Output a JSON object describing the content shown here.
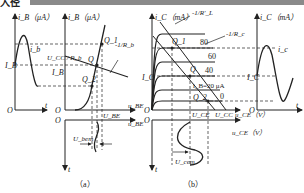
{
  "header": {
    "tag": "入径"
  },
  "panel_a": {
    "caption": "（a）",
    "left_axis": {
      "y_label": "i_B（μA）",
      "x_label": "t",
      "origin": "O",
      "level_label": "I_B",
      "curve_label": "i_b"
    },
    "input_char": {
      "y_label": "i_B（μA）",
      "x_label": "u_BE",
      "origin": "O",
      "load_line_label": "U_CC / R_b",
      "slope_label": "-1/R_b",
      "points": [
        "Q_1",
        "Q",
        "Q_2"
      ],
      "ib_level": "I_B",
      "ube_label": "U_BE"
    },
    "lower_axis": {
      "origin": "O",
      "x_label": "u_BE",
      "y_label": "t",
      "amp_label": "U_bem"
    }
  },
  "panel_b": {
    "caption": "（b）",
    "output_char": {
      "y_label": "i_C（mA）",
      "x_label": "u_CE（V）",
      "origin": "O",
      "ac_load_slope": "-1/R'_L",
      "dc_load_slope": "-1/R_c",
      "ib_curves": [
        "80",
        "60",
        "40",
        "i_B=20 μA",
        "0"
      ],
      "points": [
        "Q_1",
        "Q",
        "Q_2"
      ],
      "ic_level": "I_C",
      "uce_label": "U_CE",
      "ucc_label": "U_CC"
    },
    "right_axis": {
      "y_label": "i_C（mA）",
      "x_label": "t",
      "origin": "O",
      "level_label": "I_C",
      "curve_label": "i_c"
    },
    "lower_axis": {
      "origin": "O",
      "x_label": "u_CE（V）",
      "y_label": "t",
      "amp_label": "U_cem"
    }
  }
}
